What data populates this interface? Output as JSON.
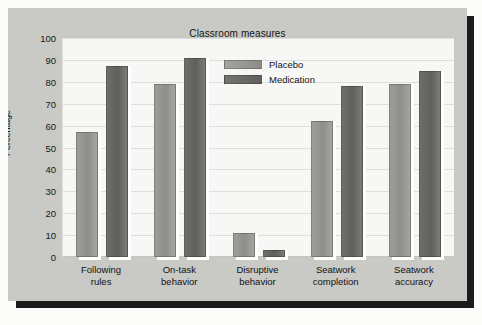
{
  "chart_data": {
    "type": "bar",
    "title": "Classroom measures",
    "xlabel": "",
    "ylabel": "Percentage",
    "ylim": [
      0,
      100
    ],
    "yticks": [
      0,
      10,
      20,
      30,
      40,
      50,
      60,
      70,
      80,
      90,
      100
    ],
    "grid": true,
    "legend_position": "top-center",
    "categories": [
      "Following rules",
      "On-task behavior",
      "Disruptive behavior",
      "Seatwork completion",
      "Seatwork accuracy"
    ],
    "category_lines": [
      [
        "Following",
        "rules"
      ],
      [
        "On-task",
        "behavior"
      ],
      [
        "Disruptive",
        "behavior"
      ],
      [
        "Seatwork",
        "completion"
      ],
      [
        "Seatwork",
        "accuracy"
      ]
    ],
    "series": [
      {
        "name": "Placebo",
        "color": "#949490",
        "values": [
          57,
          79,
          11,
          62,
          79
        ]
      },
      {
        "name": "Medication",
        "color": "#646460",
        "values": [
          87,
          91,
          3,
          78,
          85
        ]
      }
    ]
  },
  "figure": {
    "panel_color": "#c9c9c6",
    "plot_color": "#f7f7f5",
    "shadow_color": "#1c1c1c"
  }
}
